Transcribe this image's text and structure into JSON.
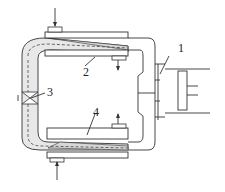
{
  "diagram": {
    "type": "schematic",
    "labels": {
      "l1": "1",
      "l2": "2",
      "l3": "3",
      "l4": "4"
    },
    "components": [
      {
        "id": "1",
        "name": "motor / drive unit (right)"
      },
      {
        "id": "2",
        "name": "upper plate / chamber"
      },
      {
        "id": "3",
        "name": "valve"
      },
      {
        "id": "4",
        "name": "lower plate / chamber"
      }
    ],
    "colors": {
      "line": "#333333",
      "fluid": "#e6e6e6",
      "background": "#ffffff"
    }
  }
}
